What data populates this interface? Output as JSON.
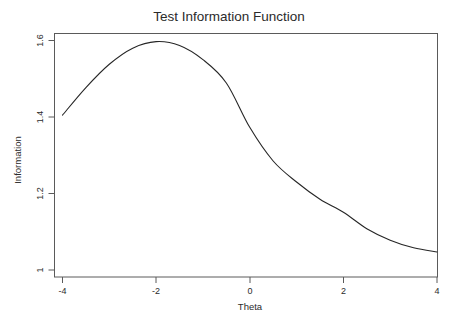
{
  "chart_data": {
    "type": "line",
    "title": "Test Information Function",
    "xlabel": "Theta",
    "ylabel": "Information",
    "xlim": [
      -4,
      4
    ],
    "ylim": [
      1.0,
      1.6
    ],
    "grid": false,
    "legend": null,
    "xticks": [
      -4,
      -2,
      0,
      2,
      4
    ],
    "xtick_labels": [
      "-4",
      "-2",
      "0",
      "2",
      "4"
    ],
    "yticks": [
      1,
      1.2,
      1.4,
      1.6
    ],
    "ytick_labels": [
      "1",
      "1.2",
      "1.4",
      "1.6"
    ],
    "series": [
      {
        "name": "Test Information",
        "x": [
          -4,
          -3.8,
          -3.6,
          -3.4,
          -3.2,
          -3,
          -2.8,
          -2.6,
          -2.4,
          -2.2,
          -2,
          -1.8,
          -1.6,
          -1.4,
          -1.2,
          -1,
          -0.8,
          -0.6,
          -0.4,
          -0.2,
          0,
          0.2,
          0.4,
          0.6,
          0.8,
          1,
          1.2,
          1.4,
          1.6,
          1.8,
          2,
          2.2,
          2.4,
          2.6,
          2.8,
          3,
          3.2,
          3.4,
          3.6,
          3.8,
          4
        ],
        "values": [
          1.405,
          1.435,
          1.463,
          1.49,
          1.515,
          1.538,
          1.557,
          1.573,
          1.585,
          1.593,
          1.597,
          1.596,
          1.591,
          1.582,
          1.568,
          1.55,
          1.528,
          1.502,
          1.473,
          1.44,
          1.373,
          1.335,
          1.3,
          1.268,
          1.34,
          1.303,
          1.266,
          1.23,
          1.196,
          1.172,
          1.151,
          1.132,
          1.115,
          1.1,
          1.088,
          1.078,
          1.07,
          1.063,
          1.057,
          1.052,
          1.047
        ]
      }
    ],
    "notes": {
      "peak_theta": -1.95,
      "peak_information": 1.597,
      "start_point": [
        -4,
        1.405
      ],
      "end_point": [
        4,
        1.047
      ]
    }
  },
  "colors": {
    "background": "#ffffff",
    "curve": "#262626",
    "frame": "#5a5a5a",
    "text": "#2b2b2b"
  }
}
